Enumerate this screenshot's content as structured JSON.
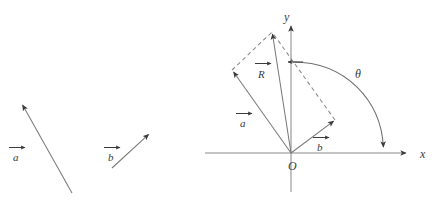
{
  "figure": {
    "stroke_color": "#7a7a7a",
    "axis_color": "#8a8a8a",
    "label_color": "#3a3a3a",
    "background": "#ffffff"
  },
  "left_panel": {
    "name": "separate-vectors-panel",
    "vectors": [
      {
        "id": "a",
        "label": "a",
        "overbar_arrow": true,
        "tail": [
          72,
          193
        ],
        "tip": [
          21,
          103
        ],
        "label_pos": [
          9,
          156
        ]
      },
      {
        "id": "b",
        "label": "b",
        "overbar_arrow": true,
        "tail": [
          112,
          168
        ],
        "tip": [
          150,
          133
        ],
        "label_pos": [
          104,
          156
        ]
      }
    ]
  },
  "right_panel": {
    "name": "parallelogram-panel",
    "origin": {
      "label": "O",
      "pos": [
        291,
        168
      ]
    },
    "axes": {
      "x": {
        "label": "x",
        "label_pos": [
          424,
          158
        ],
        "start": [
          205,
          153
        ],
        "end": [
          412,
          153
        ]
      },
      "y": {
        "label": "y",
        "label_pos": [
          288,
          17
        ],
        "start": [
          291,
          192
        ],
        "end": [
          291,
          24
        ]
      }
    },
    "vectors": [
      {
        "id": "a",
        "label": "a",
        "overbar_arrow": true,
        "tail": [
          291,
          153
        ],
        "tip": [
          232,
          70
        ],
        "label_pos": [
          237,
          122
        ]
      },
      {
        "id": "b",
        "label": "b",
        "overbar_arrow": true,
        "tail": [
          291,
          153
        ],
        "tip": [
          335,
          120
        ],
        "label_pos": [
          315,
          146
        ]
      },
      {
        "id": "R",
        "label": "R",
        "overbar_arrow": true,
        "tail": [
          291,
          153
        ],
        "tip": [
          272,
          32
        ],
        "label_pos": [
          256,
          73
        ]
      }
    ],
    "construction_lines": [
      {
        "from": [
          232,
          70
        ],
        "to": [
          272,
          32
        ],
        "style": "dashed"
      },
      {
        "from": [
          335,
          120
        ],
        "to": [
          272,
          32
        ],
        "style": "dashed"
      }
    ],
    "angle": {
      "label": "θ",
      "label_pos": [
        359,
        73
      ],
      "arc_from": [
        291,
        62
      ],
      "arc_to": [
        384,
        150
      ],
      "arrow_end": "x-axis"
    }
  }
}
